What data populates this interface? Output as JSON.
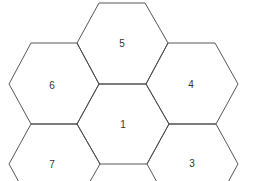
{
  "diagram": {
    "type": "hexagon-grid",
    "stroke_color": "#444444",
    "background": "#ffffff",
    "cells": [
      {
        "id": "cell-5",
        "label": "5",
        "cx": 122,
        "cy": 43
      },
      {
        "id": "cell-6",
        "label": "6",
        "cx": 53,
        "cy": 84
      },
      {
        "id": "cell-4",
        "label": "4",
        "cx": 192,
        "cy": 84
      },
      {
        "id": "cell-1",
        "label": "1",
        "cx": 123,
        "cy": 124
      },
      {
        "id": "cell-7",
        "label": "7",
        "cx": 53,
        "cy": 164
      },
      {
        "id": "cell-3",
        "label": "3",
        "cx": 192,
        "cy": 163
      }
    ]
  }
}
